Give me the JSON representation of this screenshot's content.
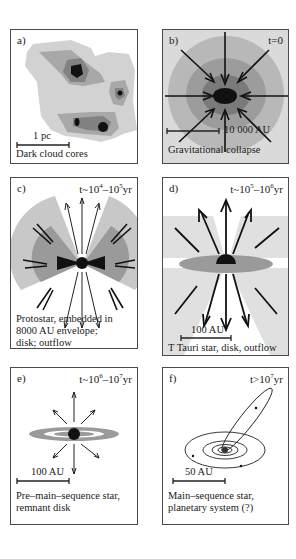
{
  "figure": {
    "panels": [
      {
        "id": "a",
        "label": "a)",
        "time": "",
        "scale": "1 pc",
        "caption": "Dark cloud cores"
      },
      {
        "id": "b",
        "label": "b)",
        "time": "t=0",
        "scale": "10 000 AU",
        "caption": "Gravitational collapse"
      },
      {
        "id": "c",
        "label": "c)",
        "time_prefix": "t~10",
        "time_exp1": "4",
        "time_mid": "–10",
        "time_exp2": "5",
        "time_suffix": "yr",
        "scale": "",
        "caption_lines": [
          "Protostar, embedded in",
          "8000 AU envelope;",
          "disk; outflow"
        ]
      },
      {
        "id": "d",
        "label": "d)",
        "time_prefix": "t~10",
        "time_exp1": "5",
        "time_mid": "–10",
        "time_exp2": "6",
        "time_suffix": "yr",
        "scale": "100 AU",
        "caption": "T Tauri star, disk, outflow"
      },
      {
        "id": "e",
        "label": "e)",
        "time_prefix": "t~10",
        "time_exp1": "6",
        "time_mid": "–10",
        "time_exp2": "7",
        "time_suffix": "yr",
        "scale": "100 AU",
        "caption_lines": [
          "Pre–main–sequence star,",
          "remnant disk"
        ]
      },
      {
        "id": "f",
        "label": "f)",
        "time_prefix": "t>10",
        "time_exp1": "7",
        "time_suffix": "yr",
        "scale": "50 AU",
        "caption_lines": [
          "Main–sequence star,",
          "planetary system (?)"
        ]
      }
    ]
  },
  "colors": {
    "light_gray": "#c8c8c8",
    "mid_gray": "#a0a0a0",
    "dark_gray": "#7a7a7a",
    "core_black": "#111111",
    "border": "#4a4a4a",
    "background": "#ffffff"
  }
}
